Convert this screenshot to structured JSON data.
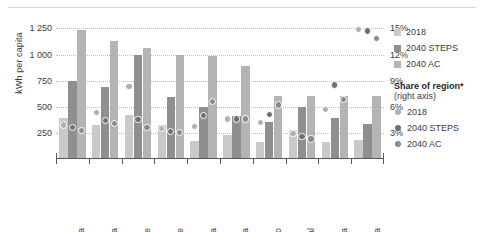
{
  "axes": {
    "left_title": "kWh per capita",
    "left_ticks": [
      "1 250",
      "1 000",
      "750",
      "500",
      "250"
    ],
    "left_tick_values": [
      1250,
      1000,
      750,
      500,
      250
    ],
    "right_ticks": [
      "15%",
      "12%",
      "9%",
      "6%",
      "3%"
    ],
    "right_tick_values": [
      15,
      12,
      9,
      6,
      3
    ]
  },
  "legend": {
    "bars": [
      {
        "label": "2018",
        "color": "#c9c9c9"
      },
      {
        "label": "2040 STEPS",
        "color": "#8f8f8f"
      },
      {
        "label": "2040 AC",
        "color": "#b4b4b4"
      }
    ],
    "heading": "Share of region*",
    "subheading": "(right axis)",
    "dots": [
      {
        "label": "2018",
        "color": "#b0b0b0"
      },
      {
        "label": "2040 STEPS",
        "color": "#6e6e6e"
      },
      {
        "label": "2040 AC",
        "color": "#8a8a8a"
      }
    ]
  },
  "chart_data": {
    "type": "bar",
    "title": "",
    "xlabel": "",
    "ylabel": "kWh per capita",
    "y2label": "Share of region*",
    "ylim": [
      0,
      1350
    ],
    "y2lim": [
      0,
      16.2
    ],
    "grid": true,
    "legend_position": "right",
    "categories": [
      "Ghana",
      "Angola",
      "Mozambique",
      "Côte d'Ivoire",
      "Tanzania",
      "Kenya",
      "DR Congo",
      "Senegal",
      "Ethiopia",
      "Nigeria"
    ],
    "series": [
      {
        "name": "2018",
        "axis": "left",
        "type": "bar",
        "unit": "kWh per capita",
        "color": "#c9c9c9",
        "values": [
          390,
          330,
          420,
          330,
          170,
          230,
          160,
          280,
          160,
          180
        ]
      },
      {
        "name": "2040 STEPS",
        "axis": "left",
        "type": "bar",
        "unit": "kWh per capita",
        "color": "#8f8f8f",
        "values": [
          750,
          690,
          1000,
          590,
          500,
          410,
          350,
          500,
          390,
          340
        ]
      },
      {
        "name": "2040 AC",
        "axis": "left",
        "type": "bar",
        "unit": "kWh per capita",
        "color": "#b4b4b4",
        "values": [
          1240,
          1130,
          1060,
          1000,
          990,
          890,
          600,
          600,
          600,
          600
        ]
      },
      {
        "name": "2018",
        "axis": "right",
        "type": "scatter",
        "unit": "%",
        "color": "#b0b0b0",
        "values": [
          3.9,
          5.3,
          8.3,
          3.5,
          3.7,
          4.6,
          4.2,
          2.9,
          5.7,
          14.9
        ]
      },
      {
        "name": "2040 STEPS",
        "axis": "right",
        "type": "scatter",
        "unit": "%",
        "color": "#6e6e6e",
        "values": [
          3.6,
          4.4,
          4.5,
          3.2,
          5.0,
          4.6,
          5.1,
          2.6,
          8.5,
          14.7
        ]
      },
      {
        "name": "2040 AC",
        "axis": "right",
        "type": "scatter",
        "unit": "%",
        "color": "#8a8a8a",
        "values": [
          3.3,
          4.1,
          3.6,
          3.0,
          6.6,
          4.6,
          6.2,
          2.3,
          6.8,
          13.8
        ]
      }
    ]
  }
}
